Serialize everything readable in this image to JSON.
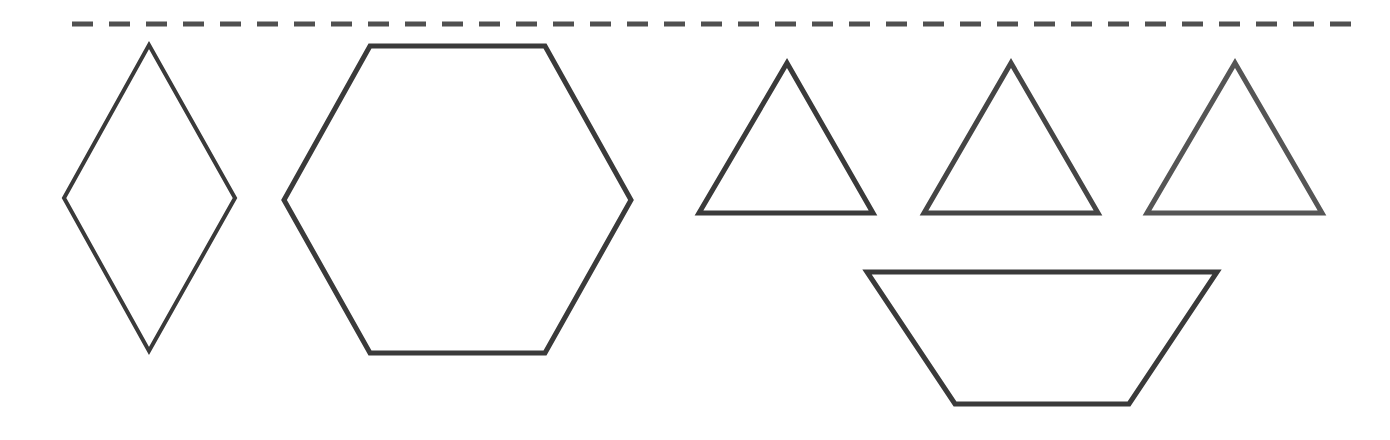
{
  "canvas": {
    "width": 1390,
    "height": 440,
    "background": "#ffffff"
  },
  "colors": {
    "stroke_dark": "#3a3a3a",
    "stroke_mid": "#454545",
    "stroke_light": "#555555",
    "dash": "#505050"
  },
  "dashed_line": {
    "x1": 72,
    "y1": 24,
    "x2": 1356,
    "y2": 24,
    "stroke_width": 5,
    "dash_length": 21,
    "gap_length": 16
  },
  "shapes": [
    {
      "id": "rhombus",
      "type": "rhombus",
      "points": "149,45 235,198 149,351 64,198",
      "stroke_width": 4
    },
    {
      "id": "hexagon",
      "type": "hexagon",
      "points": "370,46 545,46 631,200 545,353 370,353 284,200",
      "stroke_width": 5
    },
    {
      "id": "triangle-1",
      "type": "triangle",
      "points": "787,63 873,213 699,213",
      "stroke_width": 5
    },
    {
      "id": "triangle-2",
      "type": "triangle",
      "points": "1011,63 1098,213 924,213",
      "stroke_width": 5
    },
    {
      "id": "triangle-3",
      "type": "triangle",
      "points": "1235,63 1322,213 1147,213",
      "stroke_width": 5
    },
    {
      "id": "trapezoid",
      "type": "trapezoid",
      "points": "867,272 1217,272 1129,404 955,404",
      "stroke_width": 5
    }
  ]
}
